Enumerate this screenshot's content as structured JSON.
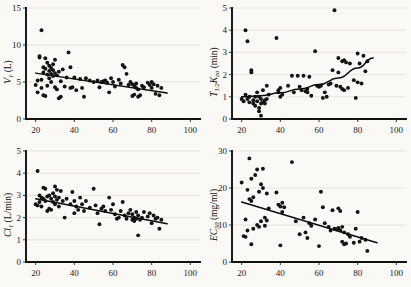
{
  "figure": {
    "background": "#faf9f6",
    "marker_color": "#141414",
    "line_color": "#0d0d0d",
    "panel_count": 4
  },
  "chart_data": [
    {
      "type": "scatter",
      "panel": "top-left",
      "title": "",
      "xlabel": "",
      "ylabel": "V₁ (L)",
      "ylabel_symbol": "V",
      "ylabel_subscript": "1",
      "ylabel_units": "(L)",
      "xlim": [
        15,
        105
      ],
      "ylim": [
        0,
        15
      ],
      "xticks": [
        20,
        40,
        60,
        80,
        100
      ],
      "yticks": [
        0,
        5,
        10,
        15
      ],
      "grid": true,
      "legend": "none",
      "trend": {
        "type": "line",
        "x": [
          20,
          88
        ],
        "y": [
          6.2,
          3.5
        ]
      },
      "x": [
        20,
        21,
        21,
        22,
        22,
        23,
        23,
        23,
        24,
        24,
        24,
        25,
        25,
        25,
        26,
        26,
        26,
        27,
        27,
        27,
        28,
        28,
        28,
        29,
        29,
        29,
        30,
        30,
        30,
        31,
        31,
        32,
        32,
        33,
        33,
        34,
        35,
        36,
        37,
        38,
        38,
        39,
        40,
        41,
        43,
        44,
        45,
        46,
        48,
        50,
        52,
        53,
        54,
        55,
        56,
        57,
        58,
        59,
        60,
        61,
        63,
        64,
        65,
        66,
        67,
        68,
        69,
        70,
        70,
        71,
        71,
        72,
        72,
        73,
        73,
        74,
        75,
        76,
        78,
        79,
        80,
        80,
        81,
        82,
        83,
        84,
        85
      ],
      "y": [
        4.6,
        5.2,
        3.6,
        8.3,
        8.5,
        12.0,
        5.3,
        4.2,
        7.0,
        6.3,
        3.2,
        8.2,
        6.8,
        3.1,
        7.6,
        6.0,
        4.5,
        7.2,
        6.5,
        5.5,
        6.9,
        6.1,
        5.0,
        7.4,
        6.6,
        5.8,
        8.0,
        6.2,
        4.3,
        5.9,
        4.0,
        6.4,
        2.8,
        5.1,
        3.0,
        6.7,
        4.4,
        5.6,
        9.0,
        7.0,
        4.2,
        4.3,
        5.6,
        3.9,
        5.4,
        4.2,
        3.0,
        5.5,
        5.2,
        5.0,
        5.2,
        4.3,
        5.0,
        5.1,
        5.2,
        4.9,
        3.6,
        5.5,
        5.0,
        4.4,
        5.3,
        4.8,
        7.3,
        7.0,
        6.1,
        4.6,
        5.0,
        4.7,
        3.1,
        4.5,
        3.3,
        4.8,
        4.2,
        4.0,
        3.0,
        3.2,
        4.5,
        4.3,
        4.9,
        4.6,
        5.0,
        4.2,
        4.7,
        3.4,
        4.5,
        3.2,
        4.2
      ]
    },
    {
      "type": "scatter",
      "panel": "top-right",
      "title": "",
      "xlabel": "",
      "ylabel": "T₁/₂Kₑₒ (min)",
      "ylabel_symbol": "T",
      "ylabel_subscript": "1/2",
      "ylabel_symbol2": "K",
      "ylabel_subscript2": "eo",
      "ylabel_units": "(min)",
      "xlim": [
        15,
        105
      ],
      "ylim": [
        0,
        5
      ],
      "xticks": [
        20,
        40,
        60,
        80,
        100
      ],
      "yticks": [
        0,
        1,
        2,
        3,
        4,
        5
      ],
      "grid": true,
      "legend": "none",
      "trend": {
        "type": "curve",
        "x": [
          20,
          30,
          40,
          50,
          60,
          70,
          80,
          88
        ],
        "y": [
          1.0,
          1.05,
          1.18,
          1.35,
          1.55,
          1.85,
          2.3,
          2.75
        ]
      },
      "x": [
        20,
        21,
        22,
        22,
        23,
        23,
        24,
        24,
        25,
        25,
        26,
        26,
        27,
        27,
        28,
        28,
        29,
        29,
        29,
        30,
        30,
        30,
        31,
        31,
        32,
        32,
        33,
        33,
        34,
        38,
        39,
        39,
        40,
        40,
        41,
        44,
        46,
        47,
        49,
        50,
        51,
        52,
        53,
        54,
        54,
        55,
        56,
        58,
        59,
        60,
        61,
        62,
        63,
        64,
        65,
        66,
        67,
        68,
        69,
        70,
        70,
        71,
        72,
        72,
        73,
        73,
        74,
        75,
        76,
        78,
        79,
        80,
        80,
        81,
        82,
        83,
        84,
        85
      ],
      "y": [
        0.9,
        0.8,
        4.0,
        1.1,
        3.5,
        0.9,
        1.0,
        0.75,
        2.2,
        2.1,
        0.85,
        0.7,
        1.0,
        0.6,
        1.2,
        0.8,
        0.5,
        0.35,
        1.0,
        0.15,
        0.7,
        0.9,
        0.75,
        1.3,
        0.85,
        0.7,
        1.5,
        0.9,
        1.1,
        3.65,
        1.3,
        1.2,
        1.4,
        1.0,
        1.1,
        1.5,
        1.95,
        1.2,
        1.95,
        1.45,
        1.3,
        1.95,
        1.25,
        1.2,
        1.35,
        1.9,
        1.05,
        3.05,
        1.5,
        1.45,
        1.5,
        0.95,
        1.2,
        1.0,
        1.55,
        1.6,
        2.2,
        4.9,
        1.5,
        2.75,
        2.1,
        1.45,
        2.6,
        1.35,
        2.65,
        1.3,
        2.55,
        1.4,
        2.5,
        1.75,
        0.95,
        2.95,
        1.65,
        2.5,
        1.6,
        2.85,
        2.15,
        2.6
      ]
    },
    {
      "type": "scatter",
      "panel": "bottom-left",
      "title": "",
      "xlabel": "",
      "ylabel": "Cl₁ (L/min)",
      "ylabel_symbol": "Cl",
      "ylabel_subscript": "1",
      "ylabel_units": "(L/min)",
      "xlim": [
        15,
        105
      ],
      "ylim": [
        0,
        5
      ],
      "xticks": [
        20,
        40,
        60,
        80,
        100
      ],
      "yticks": [
        0,
        1,
        2,
        3,
        4,
        5
      ],
      "grid": true,
      "legend": "none",
      "trend": {
        "type": "line",
        "x": [
          20,
          88
        ],
        "y": [
          2.85,
          1.72
        ]
      },
      "x": [
        20,
        21,
        21,
        22,
        22,
        23,
        23,
        24,
        24,
        25,
        25,
        26,
        26,
        27,
        27,
        28,
        28,
        29,
        29,
        30,
        30,
        30,
        31,
        31,
        32,
        32,
        33,
        34,
        35,
        36,
        38,
        39,
        40,
        40,
        41,
        42,
        43,
        44,
        45,
        46,
        48,
        50,
        51,
        52,
        53,
        54,
        55,
        56,
        58,
        59,
        60,
        61,
        62,
        63,
        64,
        65,
        66,
        67,
        68,
        69,
        70,
        70,
        71,
        71,
        72,
        72,
        73,
        73,
        74,
        75,
        76,
        78,
        79,
        80,
        81,
        82,
        83,
        84,
        85
      ],
      "y": [
        2.6,
        4.1,
        2.55,
        3.0,
        2.7,
        2.9,
        2.5,
        3.35,
        2.85,
        3.3,
        2.75,
        2.95,
        2.3,
        3.0,
        2.4,
        2.85,
        2.35,
        3.1,
        2.7,
        3.4,
        2.95,
        2.6,
        3.25,
        2.8,
        2.9,
        2.5,
        3.2,
        2.75,
        2.0,
        2.85,
        2.6,
        3.15,
        2.75,
        2.2,
        2.5,
        2.35,
        2.9,
        2.6,
        2.3,
        2.75,
        2.45,
        3.3,
        2.55,
        2.2,
        1.7,
        2.4,
        2.5,
        2.3,
        2.9,
        2.35,
        2.6,
        2.15,
        1.95,
        2.0,
        2.3,
        2.7,
        2.1,
        1.95,
        2.2,
        2.35,
        2.15,
        1.9,
        2.0,
        1.85,
        2.25,
        1.95,
        1.2,
        2.1,
        1.9,
        2.0,
        2.25,
        2.05,
        2.2,
        1.75,
        2.1,
        1.95,
        2.0,
        1.5,
        1.9
      ]
    },
    {
      "type": "scatter",
      "panel": "bottom-right",
      "title": "",
      "xlabel": "",
      "ylabel": "EC₅₀ (mg/ml)",
      "ylabel_symbol": "EC",
      "ylabel_subscript": "50",
      "ylabel_units": "(mg/ml)",
      "xlim": [
        15,
        105
      ],
      "ylim": [
        0,
        30
      ],
      "xticks": [
        20,
        40,
        60,
        80,
        100
      ],
      "yticks": [
        0,
        10,
        20,
        30
      ],
      "grid": true,
      "legend": "none",
      "trend": {
        "type": "line",
        "x": [
          20,
          90
        ],
        "y": [
          16.2,
          5.2
        ]
      },
      "x": [
        20,
        21,
        22,
        22,
        23,
        23,
        24,
        24,
        25,
        25,
        25,
        26,
        26,
        27,
        28,
        28,
        29,
        29,
        30,
        30,
        31,
        31,
        32,
        32,
        33,
        33,
        34,
        38,
        39,
        40,
        40,
        41,
        41,
        42,
        46,
        48,
        50,
        52,
        53,
        54,
        55,
        56,
        58,
        60,
        61,
        62,
        63,
        65,
        66,
        67,
        68,
        69,
        70,
        70,
        71,
        71,
        72,
        72,
        73,
        73,
        74,
        75,
        76,
        78,
        79,
        80,
        81,
        82,
        84,
        85
      ],
      "y": [
        21.5,
        7.0,
        11.5,
        6.8,
        19.5,
        8.5,
        28.0,
        17.0,
        22.5,
        16.5,
        4.8,
        17.5,
        9.0,
        23.5,
        25.0,
        10.0,
        19.0,
        9.5,
        21.0,
        11.0,
        25.2,
        20.0,
        12.0,
        9.8,
        18.5,
        11.2,
        14.5,
        18.8,
        15.5,
        15.0,
        4.5,
        16.0,
        13.5,
        14.8,
        27.0,
        11.0,
        7.5,
        12.0,
        8.0,
        6.5,
        10.5,
        9.8,
        11.5,
        4.3,
        19.0,
        14.8,
        10.5,
        9.5,
        8.5,
        14.0,
        9.0,
        8.8,
        14.5,
        9.2,
        13.8,
        8.5,
        9.5,
        5.5,
        8.0,
        4.8,
        5.0,
        7.5,
        6.8,
        5.2,
        9.0,
        13.5,
        5.5,
        6.5,
        6.0,
        3.0
      ]
    }
  ]
}
